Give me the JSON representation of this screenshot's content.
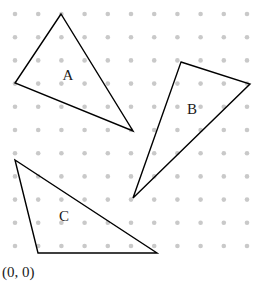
{
  "figure": {
    "width": 267,
    "height": 284,
    "background_color": "#ffffff"
  },
  "grid": {
    "name": "dot-lattice",
    "origin_x": 15,
    "origin_y": 14,
    "spacing": 23.2,
    "columns": 11,
    "rows": 11,
    "dot_radius": 2.3,
    "dot_color": "#c9c9c9"
  },
  "origin_marker": {
    "label": "(0, 0)",
    "x": 2,
    "y": 277
  },
  "shapes": [
    {
      "name": "triangle-a",
      "label": "A",
      "label_x": 68,
      "label_y": 77,
      "stroke_color": "#000000",
      "stroke_width": 1.4,
      "fill": "none",
      "points": "61,14 15,83 133,131"
    },
    {
      "name": "triangle-b",
      "label": "B",
      "label_x": 192,
      "label_y": 111,
      "stroke_color": "#000000",
      "stroke_width": 1.4,
      "fill": "none",
      "points": "181,62 250,84 133,198"
    },
    {
      "name": "triangle-c",
      "label": "C",
      "label_x": 64,
      "label_y": 218,
      "stroke_color": "#000000",
      "stroke_width": 1.4,
      "fill": "none",
      "points": "15,160 38,253 157,253"
    }
  ]
}
